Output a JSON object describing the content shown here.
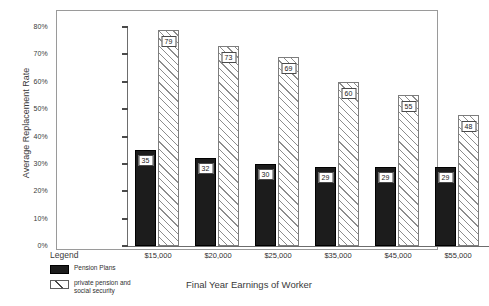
{
  "chart_data": {
    "type": "bar",
    "title": "",
    "xlabel": "Final Year Earnings of Worker",
    "ylabel": "Average Replacement Rate",
    "categories": [
      "$15,000",
      "$20,000",
      "$25,000",
      "$35,000",
      "$45,000",
      "$55,000"
    ],
    "series": [
      {
        "name": "Pension Plans",
        "style": "solid-black",
        "values": [
          35,
          32,
          30,
          29,
          29,
          29
        ]
      },
      {
        "name": "private pension and social security",
        "style": "hatched",
        "values": [
          79,
          73,
          69,
          60,
          55,
          48
        ]
      }
    ],
    "ylim": [
      0,
      80
    ],
    "yticks": [
      "0%",
      "10%",
      "20%",
      "30%",
      "40%",
      "50%",
      "60%",
      "70%",
      "80%"
    ],
    "ytick_values": [
      0,
      10,
      20,
      30,
      40,
      50,
      60,
      70,
      80
    ],
    "grid": false,
    "legend_position": "bottom-left",
    "value_labels": true,
    "unit": "%"
  },
  "legend": {
    "title": "Legend",
    "entries": [
      {
        "label": "Pension Plans",
        "label_line1": "Pension Plans",
        "label_line2": ""
      },
      {
        "label": "private pension and social security",
        "label_line1": "private pension and",
        "label_line2": "social security"
      }
    ]
  },
  "colors": {
    "series1": "#1c1c1c",
    "series2_hatch": "#8d8d8d",
    "axis": "#6d6d6d",
    "frame": "#9a9a9a",
    "text": "#2f2f2f",
    "background": "#ffffff"
  }
}
